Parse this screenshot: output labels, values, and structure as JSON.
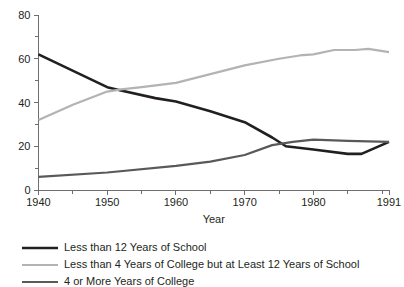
{
  "chart_data": {
    "type": "line",
    "title": "",
    "xlabel": "Year",
    "ylabel": "",
    "xlim": [
      1940,
      1991
    ],
    "ylim": [
      0,
      80
    ],
    "grid": false,
    "legend_position": "bottom-left",
    "x_ticks": [
      1940,
      1945,
      1950,
      1955,
      1960,
      1965,
      1970,
      1975,
      1980,
      1985,
      1990,
      1991
    ],
    "x_tick_labels": [
      "1940",
      "",
      "1950",
      "",
      "1960",
      "",
      "1970",
      "",
      "1980",
      "",
      "",
      "1991"
    ],
    "y_ticks": [
      0,
      10,
      20,
      30,
      40,
      50,
      60,
      70,
      80
    ],
    "y_tick_labels": [
      "0",
      "",
      "20",
      "",
      "40",
      "",
      "60",
      "",
      "80"
    ],
    "series": [
      {
        "name": "Less than 12 Years of School",
        "color": "#231f20",
        "width": 2.6,
        "x": [
          1940,
          1950,
          1952,
          1957,
          1960,
          1965,
          1970,
          1974,
          1976,
          1980,
          1985,
          1987,
          1991
        ],
        "values": [
          62,
          47,
          45.5,
          42,
          40.5,
          36,
          31,
          24,
          20,
          18.5,
          16.5,
          16.5,
          22
        ]
      },
      {
        "name": "Less than 4 Years of College but at Least 12 Years of School",
        "color": "#b3b3b3",
        "width": 2.2,
        "x": [
          1940,
          1945,
          1950,
          1952,
          1955,
          1960,
          1965,
          1970,
          1975,
          1978,
          1980,
          1983,
          1986,
          1988,
          1991
        ],
        "values": [
          32,
          39,
          45,
          46,
          47,
          49,
          53,
          57,
          60,
          61.5,
          62,
          64,
          64,
          64.5,
          63
        ]
      },
      {
        "name": "4 or More Years of College",
        "color": "#595959",
        "width": 2.2,
        "x": [
          1940,
          1950,
          1960,
          1965,
          1970,
          1974,
          1977,
          1980,
          1985,
          1991
        ],
        "values": [
          6,
          8,
          11,
          13,
          16,
          20.5,
          22,
          23,
          22.5,
          22
        ]
      }
    ]
  },
  "legend": {
    "items": [
      {
        "label": "Less than 12 Years of School"
      },
      {
        "label": "Less than 4 Years of College but at Least 12 Years of School"
      },
      {
        "label": "4 or More Years of College"
      }
    ]
  }
}
